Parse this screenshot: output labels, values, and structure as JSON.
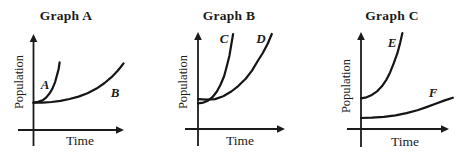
{
  "figure": {
    "ink_color": "#1b1b1b",
    "background_color": "#ffffff"
  },
  "panels": [
    {
      "title": "Graph A",
      "ylabel": "Population",
      "xlabel": "Time",
      "curves": [
        {
          "label": "A"
        },
        {
          "label": "B"
        }
      ]
    },
    {
      "title": "Graph B",
      "ylabel": "Population",
      "xlabel": "Time",
      "curves": [
        {
          "label": "C"
        },
        {
          "label": "D"
        }
      ]
    },
    {
      "title": "Graph C",
      "ylabel": "Population",
      "xlabel": "Time",
      "curves": [
        {
          "label": "E"
        },
        {
          "label": "F"
        }
      ]
    }
  ],
  "chart_data": [
    {
      "type": "line",
      "title": "Graph A",
      "xlabel": "Time",
      "ylabel": "Population",
      "axes": {
        "ticks": "none",
        "scale": "qualitative; point values normalized 0-1 of plot area"
      },
      "series": [
        {
          "name": "A",
          "description": "rises steeply (exponential) very early in time",
          "x": [
            0,
            0.05,
            0.1,
            0.14,
            0.18,
            0.21,
            0.24,
            0.26,
            0.28,
            0.29
          ],
          "y": [
            0.29,
            0.3,
            0.315,
            0.345,
            0.39,
            0.44,
            0.51,
            0.58,
            0.65,
            0.72
          ]
        },
        {
          "name": "B",
          "description": "nearly flat at first, steep exponential rise late in time",
          "x": [
            0,
            0.1,
            0.2,
            0.3,
            0.4,
            0.5,
            0.6,
            0.7,
            0.79,
            0.87,
            0.93,
            0.97,
            1.0
          ],
          "y": [
            0.29,
            0.292,
            0.298,
            0.31,
            0.33,
            0.355,
            0.39,
            0.44,
            0.5,
            0.565,
            0.625,
            0.67,
            0.71
          ]
        }
      ]
    },
    {
      "type": "line",
      "title": "Graph B",
      "xlabel": "Time",
      "ylabel": "Population",
      "axes": {
        "ticks": "none",
        "scale": "qualitative; point values normalized 0-1 of plot area"
      },
      "series": [
        {
          "name": "C",
          "description": "starts slightly lower, steep exponential rise reaching top at mid time; crosses D near start",
          "x": [
            0,
            0.06,
            0.11,
            0.16,
            0.21,
            0.25,
            0.29,
            0.32,
            0.35,
            0.37,
            0.39
          ],
          "y": [
            0.27,
            0.278,
            0.298,
            0.335,
            0.395,
            0.465,
            0.555,
            0.66,
            0.775,
            0.89,
            1.0
          ]
        },
        {
          "name": "D",
          "description": "starts slightly higher, exponential rise reaching top later in time",
          "x": [
            0,
            0.1,
            0.19,
            0.28,
            0.37,
            0.45,
            0.53,
            0.6,
            0.66,
            0.72,
            0.775,
            0.82
          ],
          "y": [
            0.315,
            0.308,
            0.315,
            0.345,
            0.395,
            0.455,
            0.53,
            0.615,
            0.71,
            0.8,
            0.9,
            1.0
          ]
        }
      ]
    },
    {
      "type": "line",
      "title": "Graph C",
      "xlabel": "Time",
      "ylabel": "Population",
      "axes": {
        "ticks": "none",
        "scale": "qualitative; point values normalized 0-1 of plot area"
      },
      "series": [
        {
          "name": "E",
          "description": "starts at higher population, steep exponential rise to top by mid time",
          "x": [
            0,
            0.06,
            0.12,
            0.18,
            0.23,
            0.28,
            0.32,
            0.36,
            0.4,
            0.43,
            0.455
          ],
          "y": [
            0.32,
            0.33,
            0.355,
            0.395,
            0.445,
            0.515,
            0.59,
            0.685,
            0.79,
            0.895,
            1.0
          ]
        },
        {
          "name": "F",
          "description": "starts low, slow gradual rise across full time span",
          "x": [
            0,
            0.12,
            0.25,
            0.38,
            0.5,
            0.62,
            0.72,
            0.82,
            0.92,
            1.01
          ],
          "y": [
            0.115,
            0.118,
            0.127,
            0.143,
            0.166,
            0.196,
            0.228,
            0.263,
            0.298,
            0.325
          ]
        }
      ]
    }
  ]
}
